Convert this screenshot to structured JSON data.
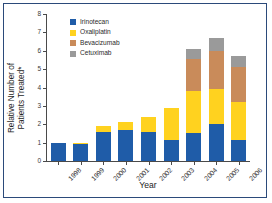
{
  "chart_data": {
    "type": "bar",
    "subtype": "stacked-vertical",
    "title": "",
    "xlabel": "Year",
    "ylabel": "Relative Number of\nPatients Treated*",
    "ylabel_line1": "Relative Number of",
    "ylabel_line2": "Patients Treated*",
    "categories": [
      "1998",
      "1999",
      "2000",
      "2001",
      "2002",
      "2003",
      "2004",
      "2005",
      "2006"
    ],
    "ylim": [
      0,
      8
    ],
    "yticks": [
      "0",
      "1",
      "2",
      "3",
      "4",
      "5",
      "6",
      "7",
      "8"
    ],
    "grid": false,
    "legend_position": "upper-left-inside",
    "series": [
      {
        "name": "Irinotecan",
        "color": "#1f5ca8",
        "values": [
          1.0,
          0.9,
          1.6,
          1.7,
          1.6,
          1.15,
          1.5,
          2.0,
          1.15
        ]
      },
      {
        "name": "Oxaliplatin",
        "color": "#ffd21f",
        "values": [
          0.0,
          0.1,
          0.28,
          0.4,
          0.82,
          1.75,
          2.3,
          1.9,
          2.05
        ]
      },
      {
        "name": "Bevacizumab",
        "color": "#c98b5a",
        "values": [
          0.0,
          0.0,
          0.0,
          0.0,
          0.0,
          0.0,
          1.75,
          2.1,
          1.9
        ]
      },
      {
        "name": "Cetuximab",
        "color": "#9a9a9a",
        "values": [
          0.0,
          0.0,
          0.0,
          0.0,
          0.0,
          0.0,
          0.55,
          0.7,
          0.6
        ]
      }
    ],
    "totals": [
      1.0,
      1.0,
      1.88,
      2.1,
      2.42,
      2.9,
      6.1,
      6.7,
      5.7
    ]
  },
  "legend": {
    "items": [
      {
        "label": "Irinotecan",
        "color": "#1f5ca8"
      },
      {
        "label": "Oxaliplatin",
        "color": "#ffd21f"
      },
      {
        "label": "Bevacizumab",
        "color": "#c98b5a"
      },
      {
        "label": "Cetuximab",
        "color": "#9a9a9a"
      }
    ]
  },
  "colors": {
    "border": "#2b4a7a",
    "axis": "#4a4a4a",
    "text": "#1d1d1d",
    "background": "#ffffff"
  }
}
